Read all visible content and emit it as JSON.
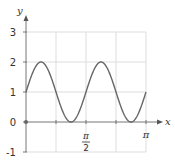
{
  "chart_data": {
    "type": "line",
    "title": "",
    "function": "y = 1 + sin(4x)",
    "xlabel": "x",
    "ylabel": "y",
    "xlim": [
      0,
      3.14159
    ],
    "ylim": [
      -1,
      3
    ],
    "grid": true,
    "x_gridlines": [
      "π/4",
      "π/2",
      "3π/4",
      "π"
    ],
    "x_tick_labels": [
      {
        "value": "π/2",
        "numerator": "π",
        "denominator": "2"
      },
      {
        "value": "π",
        "text": "π"
      }
    ],
    "y_tick_labels": [
      "3",
      "2",
      "1",
      "0",
      "-1"
    ],
    "y_ticks": [
      3,
      2,
      1,
      0,
      -1
    ],
    "series": [
      {
        "name": "f(x)",
        "x": [
          0,
          0.3927,
          0.7854,
          1.1781,
          1.5708,
          1.9635,
          2.3562,
          2.7489,
          3.1416
        ],
        "x_labels": [
          "0",
          "π/8",
          "π/4",
          "3π/8",
          "π/2",
          "5π/8",
          "3π/4",
          "7π/8",
          "π"
        ],
        "values": [
          1,
          2,
          1,
          0,
          1,
          2,
          1,
          0,
          1
        ]
      }
    ],
    "annotations": [
      "origin dot at (0,0)"
    ],
    "legend": null
  },
  "colors": {
    "curve": "#666666",
    "axis": "#777777",
    "grid": "#dddddd",
    "text": "#333333"
  }
}
